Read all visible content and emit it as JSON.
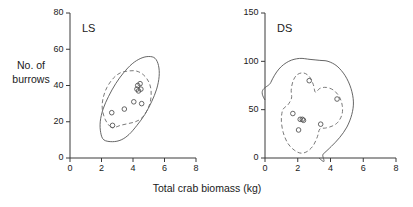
{
  "figure": {
    "x_axis_title": "Total crab biomass (kg)",
    "y_axis_title_line1": "No. of",
    "y_axis_title_line2": "burrows"
  },
  "chart_data": [
    {
      "type": "scatter",
      "title": "LS",
      "panel_label": "LS",
      "xlabel": "Total crab biomass (kg)",
      "ylabel": "No. of burrows",
      "xlim": [
        0,
        8
      ],
      "ylim": [
        0,
        80
      ],
      "xticks": [
        0,
        2,
        4,
        6,
        8
      ],
      "yticks": [
        0,
        20,
        40,
        60,
        80
      ],
      "grid": false,
      "legend": "none",
      "x": [
        2.7,
        2.65,
        3.45,
        4.05,
        4.25,
        4.3,
        4.35,
        4.45,
        4.5,
        4.55
      ],
      "y": [
        18,
        25,
        27,
        31,
        38,
        40,
        37,
        41,
        38,
        30
      ],
      "marker": "open-circle",
      "contours": [
        {
          "name": "outer-95-contour",
          "style": "solid",
          "points": [
            [
              2.15,
              10
            ],
            [
              1.95,
              14
            ],
            [
              1.92,
              20
            ],
            [
              2.1,
              27
            ],
            [
              2.45,
              34
            ],
            [
              2.9,
              41
            ],
            [
              3.4,
              47
            ],
            [
              3.95,
              52
            ],
            [
              4.5,
              55
            ],
            [
              5.0,
              56
            ],
            [
              5.4,
              55
            ],
            [
              5.62,
              51
            ],
            [
              5.66,
              45
            ],
            [
              5.5,
              38
            ],
            [
              5.18,
              31
            ],
            [
              4.75,
              24
            ],
            [
              4.25,
              18
            ],
            [
              3.75,
              13
            ],
            [
              3.25,
              10
            ],
            [
              2.7,
              9
            ]
          ]
        },
        {
          "name": "inner-50-contour",
          "style": "dashed",
          "points": [
            [
              2.6,
              17
            ],
            [
              2.25,
              21
            ],
            [
              2.05,
              27
            ],
            [
              2.1,
              33
            ],
            [
              2.35,
              39
            ],
            [
              2.75,
              44
            ],
            [
              3.2,
              47
            ],
            [
              3.7,
              48
            ],
            [
              4.2,
              48
            ],
            [
              4.65,
              46
            ],
            [
              5.0,
              42
            ],
            [
              5.15,
              37
            ],
            [
              5.1,
              31
            ],
            [
              4.88,
              26
            ],
            [
              4.55,
              22
            ],
            [
              4.15,
              20
            ],
            [
              3.7,
              19
            ],
            [
              3.2,
              18
            ],
            [
              2.88,
              17
            ]
          ]
        }
      ]
    },
    {
      "type": "scatter",
      "title": "DS",
      "panel_label": "DS",
      "xlabel": "Total crab biomass (kg)",
      "ylabel": "No. of burrows",
      "xlim": [
        0,
        8
      ],
      "ylim": [
        0,
        150
      ],
      "xticks": [
        0,
        2,
        4,
        6,
        8
      ],
      "yticks": [
        0,
        50,
        100,
        150
      ],
      "grid": false,
      "legend": "none",
      "x": [
        1.7,
        2.05,
        2.15,
        2.28,
        2.35,
        2.7,
        3.4,
        4.4
      ],
      "y": [
        46,
        29,
        40,
        40,
        39,
        80,
        35,
        61
      ],
      "marker": "open-circle",
      "contours": [
        {
          "name": "outer-95-contour",
          "style": "solid",
          "points": [
            [
              0.0,
              60
            ],
            [
              0.35,
              78
            ],
            [
              0.85,
              92
            ],
            [
              1.45,
              100
            ],
            [
              2.1,
              103
            ],
            [
              2.75,
              102
            ],
            [
              3.35,
              101
            ],
            [
              3.85,
              100
            ],
            [
              4.4,
              95
            ],
            [
              4.9,
              85
            ],
            [
              5.25,
              72
            ],
            [
              5.4,
              58
            ],
            [
              5.3,
              45
            ],
            [
              5.0,
              32
            ],
            [
              4.55,
              21
            ],
            [
              4.05,
              12
            ],
            [
              3.55,
              4
            ],
            [
              3.3,
              0
            ]
          ]
        },
        {
          "name": "inner-50-contour",
          "style": "dashed",
          "points": [
            [
              1.05,
              48
            ],
            [
              1.0,
              38
            ],
            [
              1.12,
              26
            ],
            [
              1.4,
              15
            ],
            [
              1.8,
              8
            ],
            [
              2.2,
              5
            ],
            [
              2.6,
              7
            ],
            [
              2.95,
              13
            ],
            [
              3.2,
              22
            ],
            [
              3.35,
              30
            ],
            [
              3.7,
              31
            ],
            [
              4.1,
              33
            ],
            [
              4.45,
              37
            ],
            [
              4.7,
              45
            ],
            [
              4.72,
              54
            ],
            [
              4.55,
              63
            ],
            [
              4.2,
              70
            ],
            [
              3.75,
              73
            ],
            [
              3.35,
              72
            ],
            [
              3.08,
              68
            ],
            [
              2.95,
              76
            ],
            [
              2.72,
              84
            ],
            [
              2.35,
              88
            ],
            [
              1.95,
              86
            ],
            [
              1.7,
              79
            ],
            [
              1.6,
              70
            ],
            [
              1.62,
              62
            ],
            [
              1.4,
              55
            ],
            [
              1.18,
              52
            ]
          ]
        }
      ]
    }
  ]
}
